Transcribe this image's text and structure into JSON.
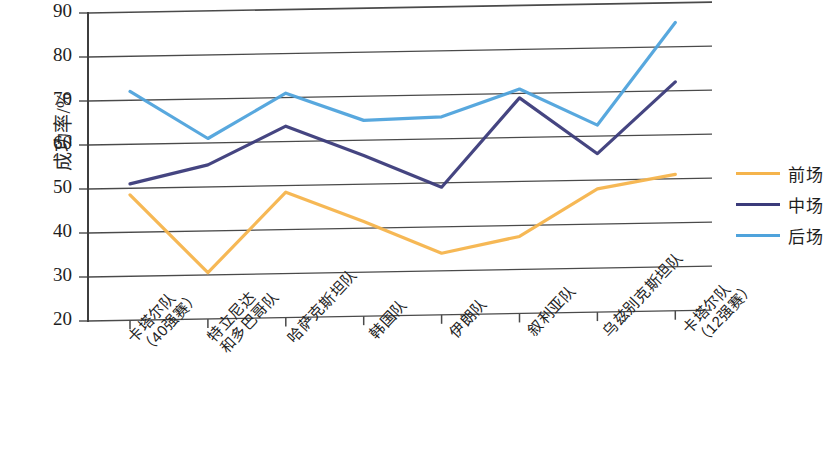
{
  "chart_data": {
    "type": "line",
    "title": "",
    "xlabel": "",
    "ylabel": "成功率/%",
    "ylim": [
      20,
      90
    ],
    "yticks": [
      20,
      30,
      40,
      50,
      60,
      70,
      80,
      90
    ],
    "grid": true,
    "legend_position": "right",
    "categories": [
      "卡塔尔队\n（40强赛）",
      "特立尼达\n和多巴哥队",
      "哈萨克斯坦队",
      "韩国队",
      "伊朗队",
      "叙利亚队",
      "乌兹别克斯坦队",
      "卡塔尔队\n（12强赛）"
    ],
    "series": [
      {
        "name": "前场",
        "color": "#F5B44C",
        "values": [
          48.5,
          30.5,
          48.5,
          41.5,
          34.0,
          37.5,
          48.0,
          51.0
        ]
      },
      {
        "name": "中场",
        "color": "#3B3B7A",
        "values": [
          51.0,
          55.0,
          63.5,
          56.5,
          49.0,
          69.0,
          56.0,
          72.0
        ]
      },
      {
        "name": "后场",
        "color": "#4FA3DC",
        "values": [
          72.0,
          61.0,
          71.0,
          64.5,
          65.0,
          71.0,
          62.5,
          85.5
        ]
      }
    ]
  },
  "legend": {
    "items": [
      {
        "label": "前场",
        "color": "#F5B44C"
      },
      {
        "label": "中场",
        "color": "#3B3B7A"
      },
      {
        "label": "后场",
        "color": "#4FA3DC"
      }
    ]
  },
  "axis": {
    "y_title": "成功率/%",
    "y_tick_labels": [
      "90",
      "80",
      "70",
      "60",
      "50",
      "40",
      "30",
      "20"
    ]
  }
}
